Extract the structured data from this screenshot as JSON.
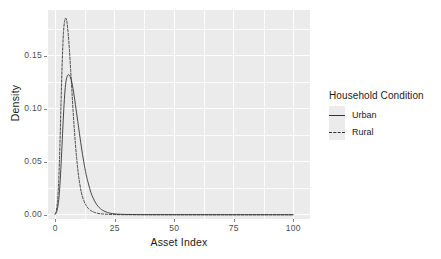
{
  "chart_data": {
    "type": "line",
    "title": "",
    "subtitle": "",
    "xlabel": "Asset Index",
    "ylabel": "Density",
    "xlim": [
      -3,
      107
    ],
    "ylim": [
      -0.004,
      0.193
    ],
    "x_ticks": [
      0,
      25,
      50,
      75,
      100
    ],
    "x_tick_labels": [
      "0",
      "25",
      "50",
      "75",
      "100"
    ],
    "y_ticks": [
      0.0,
      0.05,
      0.1,
      0.15
    ],
    "y_tick_labels": [
      "0.00",
      "0.05",
      "0.10",
      "0.15"
    ],
    "x_minor_ticks": [
      12.5,
      37.5,
      62.5,
      87.5
    ],
    "y_minor_ticks": [
      0.025,
      0.075,
      0.125,
      0.175
    ],
    "grid": true,
    "panel_background": "#ebebeb",
    "grid_color": "#ffffff",
    "legend_position": "right",
    "legend_title": "Household Condition",
    "series": [
      {
        "name": "Urban",
        "linestyle": "solid",
        "color": "#333333",
        "peak_x": 6.2,
        "peak_y": 0.132,
        "x": [
          0.0,
          0.5,
          1.0,
          1.5,
          2.0,
          2.5,
          3.0,
          3.5,
          4.0,
          4.5,
          5.0,
          5.5,
          6.0,
          6.5,
          7.0,
          7.5,
          8.0,
          8.5,
          9.0,
          9.5,
          10.0,
          11.0,
          12.0,
          13.0,
          14.0,
          15.0,
          16.0,
          17.0,
          18.0,
          19.0,
          20.0,
          22.0,
          24.0,
          26.0,
          28.0,
          30.0,
          35.0,
          40.0,
          50.0,
          60.0,
          70.0,
          80.0,
          90.0,
          100.0
        ],
        "y": [
          0.0005,
          0.002,
          0.006,
          0.014,
          0.028,
          0.048,
          0.071,
          0.094,
          0.113,
          0.125,
          0.13,
          0.132,
          0.1315,
          0.129,
          0.125,
          0.119,
          0.112,
          0.104,
          0.096,
          0.088,
          0.08,
          0.064,
          0.05,
          0.038,
          0.029,
          0.021,
          0.0155,
          0.0112,
          0.008,
          0.0057,
          0.0041,
          0.0021,
          0.0011,
          0.0006,
          0.0004,
          0.0003,
          0.00015,
          0.0001,
          6e-05,
          4e-05,
          3e-05,
          2e-05,
          2e-05,
          1e-05
        ]
      },
      {
        "name": "Rural",
        "linestyle": "dashed",
        "color": "#333333",
        "peak_x": 4.6,
        "peak_y": 0.185,
        "x": [
          0.0,
          0.5,
          1.0,
          1.5,
          2.0,
          2.5,
          3.0,
          3.5,
          4.0,
          4.3,
          4.6,
          5.0,
          5.5,
          6.0,
          6.5,
          7.0,
          7.5,
          8.0,
          8.5,
          9.0,
          9.5,
          10.0,
          11.0,
          12.0,
          13.0,
          14.0,
          15.0,
          16.0,
          17.0,
          18.0,
          19.0,
          20.0,
          22.0,
          24.0,
          26.0,
          28.0,
          30.0,
          35.0,
          40.0,
          50.0,
          60.0,
          70.0,
          80.0,
          90.0,
          100.0
        ],
        "y": [
          0.0008,
          0.004,
          0.013,
          0.032,
          0.065,
          0.107,
          0.146,
          0.172,
          0.183,
          0.185,
          0.185,
          0.181,
          0.17,
          0.155,
          0.137,
          0.118,
          0.099,
          0.082,
          0.067,
          0.054,
          0.043,
          0.034,
          0.021,
          0.0135,
          0.0088,
          0.0058,
          0.0039,
          0.0027,
          0.0019,
          0.0013,
          0.0009,
          0.0007,
          0.0004,
          0.0002,
          0.00012,
          8e-05,
          6e-05,
          3e-05,
          2e-05,
          2e-05,
          1e-05,
          1e-05,
          1e-05,
          1e-05,
          1e-05
        ]
      }
    ]
  },
  "legend": {
    "title": "Household Condition",
    "items": [
      {
        "label": "Urban",
        "style": "solid"
      },
      {
        "label": "Rural",
        "style": "dashed"
      }
    ]
  },
  "axes": {
    "x_title": "Asset Index",
    "y_title": "Density"
  }
}
